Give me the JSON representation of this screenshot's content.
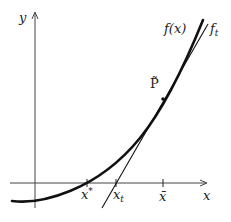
{
  "diagram": {
    "axes": {
      "x_label": "x",
      "y_label": "y"
    },
    "curves": {
      "function_label": "f(x)",
      "tangent_label": "f",
      "tangent_label_sub": "t"
    },
    "points": {
      "tangent_point_label": "P̃"
    },
    "ticks": {
      "root_label": "x",
      "root_label_sup": "*",
      "tangent_root_label": "x",
      "tangent_root_label_sub": "t",
      "bar_x_label": "x̄"
    },
    "colors": {
      "stroke": "#111111",
      "axis": "#444444"
    }
  }
}
